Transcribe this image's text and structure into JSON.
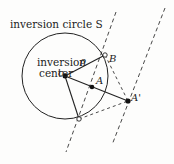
{
  "diagram": {
    "title_label": "inversion circle S",
    "center_label_line1": "inversion",
    "center_label_line2": "center",
    "center_symbol": "c",
    "radius_symbol": "ρ",
    "point_b": "B",
    "point_a": "A",
    "point_a_prime": "A'",
    "colors": {
      "stroke": "#222222",
      "background": "#fdfdfc"
    }
  }
}
